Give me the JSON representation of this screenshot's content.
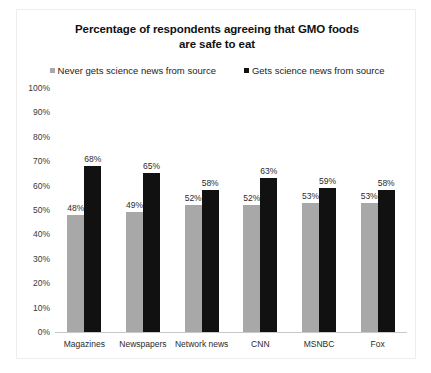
{
  "chart_data": {
    "type": "bar",
    "title": "Percentage of respondents agreeing that GMO foods are safe to eat",
    "title_lines": [
      "Percentage of respondents agreeing that GMO foods",
      "are safe to eat"
    ],
    "xlabel": "",
    "ylabel": "",
    "ylim": [
      0,
      100
    ],
    "ytick_labels": [
      "100%",
      "90%",
      "80%",
      "70%",
      "60%",
      "50%",
      "40%",
      "30%",
      "20%",
      "10%",
      "0%"
    ],
    "ytick_values": [
      100,
      90,
      80,
      70,
      60,
      50,
      40,
      30,
      20,
      10,
      0
    ],
    "grid": false,
    "legend_position": "top-center",
    "value_suffix": "%",
    "categories": [
      "Magazines",
      "Newspapers",
      "Network news",
      "CNN",
      "MSNBC",
      "Fox"
    ],
    "series": [
      {
        "name": "Never gets science news from source",
        "color": "#a8a8a8",
        "values": [
          48,
          49,
          52,
          52,
          53,
          53
        ],
        "labels": [
          "48%",
          "49%",
          "52%",
          "52%",
          "53%",
          "53%"
        ]
      },
      {
        "name": "Gets science news from source",
        "color": "#111111",
        "values": [
          68,
          65,
          58,
          63,
          59,
          58
        ],
        "labels": [
          "68%",
          "65%",
          "58%",
          "63%",
          "59%",
          "58%"
        ]
      }
    ]
  },
  "colors": {
    "series_never": "#a8a8a8",
    "series_gets": "#111111",
    "frame_border": "#ededed",
    "axis_line": "#c9c9c9",
    "text": "#2b2b2b",
    "background": "#ffffff"
  }
}
